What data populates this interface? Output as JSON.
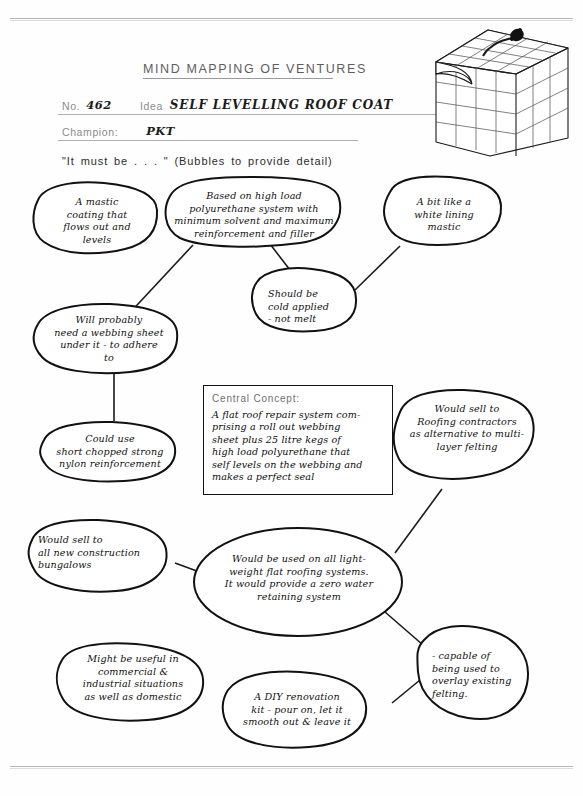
{
  "document": {
    "title": "MIND MAPPING OF VENTURES",
    "fields": [
      {
        "label": "No.",
        "value": "462"
      },
      {
        "label": "Idea",
        "value": "SELF LEVELLING ROOF COAT"
      },
      {
        "label": "Champion:",
        "value": "PKT"
      }
    ],
    "prompt": "\"It must be . . . \" (Bubbles to provide detail)"
  },
  "illustration": {
    "name": "cube-diagram",
    "description": "Layered cube with grid of blocks, peeled corner flap and applicator nozzle"
  },
  "central_concept": {
    "label": "Central Concept:",
    "body": "A flat roof repair system com-\nprising a roll out webbing\nsheet plus 25 litre kegs of\nhigh load polyurethane that\nself levels on the webbing and\nmakes a perfect seal"
  },
  "bubbles": [
    {
      "id": "mastic-coating",
      "text": "A mastic\ncoating that\nflows out and\nlevels"
    },
    {
      "id": "polyurethane-system",
      "text": "Based on high load\npolyurethane system with\nminimum solvent and maximum\nreinforcement and filler"
    },
    {
      "id": "white-lining-mastic",
      "text": "A bit like a\nwhite lining\nmastic"
    },
    {
      "id": "cold-applied",
      "text": "Should be\ncold applied\n- not melt"
    },
    {
      "id": "webbing-sheet",
      "text": "Will probably\nneed a webbing sheet\nunder it - to adhere\nto"
    },
    {
      "id": "nylon-reinforcement",
      "text": "Could use\nshort chopped strong\nnylon reinforcement"
    },
    {
      "id": "roofing-contractors",
      "text": "Would sell to\nRoofing contractors\nas alternative to multi-\nlayer felting"
    },
    {
      "id": "new-construction-bungalows",
      "text": "Would sell to\nall new construction\nbungalows"
    },
    {
      "id": "lightweight-flat-roofing",
      "text": "Would be used on all light-\nweight flat roofing systems.\nIt would provide a zero water\nretaining system"
    },
    {
      "id": "overlay-existing-felting",
      "text": "- capable of\nbeing used to\noverlay existing\nfelting."
    },
    {
      "id": "commercial-industrial",
      "text": "Might be useful in\ncommercial &\nindustrial situations\nas well as domestic"
    },
    {
      "id": "diy-renovation-kit",
      "text": "A DIY renovation\nkit - pour on, let it\nsmooth out & leave it"
    }
  ],
  "colors": {
    "ink": "#111111",
    "paper": "#fefefe",
    "form_label": "#8b8b8b",
    "rule": "#b0b0b0"
  }
}
